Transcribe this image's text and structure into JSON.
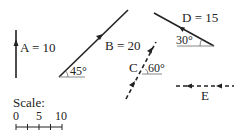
{
  "diagram": {
    "title": "",
    "vectors": [
      {
        "id": "A",
        "label": "A = 10",
        "magnitude": 10,
        "direction": "up",
        "style": "solid"
      },
      {
        "id": "B",
        "label": "B = 20",
        "magnitude": 20,
        "angle_label": "45°",
        "direction": "up-right",
        "style": "solid"
      },
      {
        "id": "C",
        "label": "C",
        "angle_label": "60°",
        "direction": "up-right",
        "style": "dashed"
      },
      {
        "id": "D",
        "label": "D = 15",
        "magnitude": 15,
        "angle_label": "30°",
        "direction": "up-left",
        "style": "solid"
      },
      {
        "id": "E",
        "label": "E",
        "direction": "left",
        "style": "dashed"
      }
    ],
    "scale": {
      "label": "Scale:",
      "ticks": [
        "0",
        "5",
        "10"
      ]
    },
    "colors": {
      "stroke": "#222222",
      "reference_line": "#888888",
      "background": "#ffffff"
    }
  }
}
